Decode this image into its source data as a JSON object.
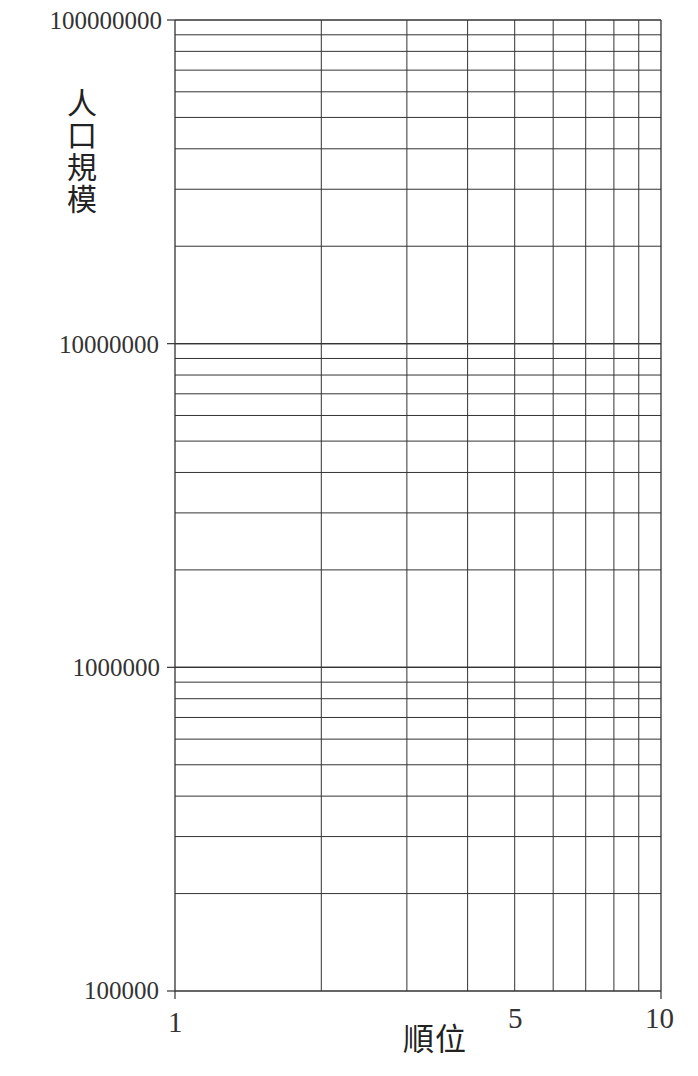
{
  "chart_data": {
    "type": "line",
    "title": "",
    "xlabel": "順位",
    "ylabel": "人口規模",
    "xscale": "log",
    "yscale": "log",
    "xlim": [
      1,
      10
    ],
    "ylim": [
      100000,
      100000000
    ],
    "x_tick_labels": [
      {
        "value": 1,
        "label": "1"
      },
      {
        "value": 5,
        "label": "5"
      },
      {
        "value": 10,
        "label": "10"
      }
    ],
    "y_tick_labels": [
      {
        "value": 100000000,
        "label": "100000000"
      },
      {
        "value": 10000000,
        "label": "10000000"
      },
      {
        "value": 1000000,
        "label": "1000000"
      },
      {
        "value": 100000,
        "label": "100000"
      }
    ],
    "grid": true,
    "x_gridlines": [
      1,
      2,
      3,
      4,
      5,
      6,
      7,
      8,
      9,
      10
    ],
    "y_gridlines_per_decade": [
      1,
      2,
      3,
      4,
      5,
      6,
      7,
      8,
      9,
      10
    ],
    "series": [],
    "note": "Blank log-log graph paper (rank-size plot template) with no data plotted"
  },
  "axes": {
    "xlabel_chars": "順位",
    "ylabel_chars": [
      "人",
      "口",
      "規",
      "模"
    ]
  },
  "colors": {
    "grid": "#333333",
    "background": "#ffffff",
    "text": "#222222"
  }
}
